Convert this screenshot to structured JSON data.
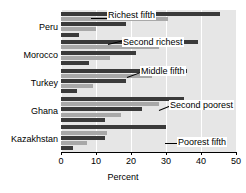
{
  "chart_data": {
    "type": "bar",
    "orientation": "horizontal",
    "title": "",
    "xlabel": "Percent",
    "ylabel": "",
    "xlim": [
      0,
      50
    ],
    "xticks": [
      0,
      10,
      20,
      30,
      40,
      50
    ],
    "grid": true,
    "legend_position": "annotations",
    "categories": [
      "Peru",
      "Morocco",
      "Turkey",
      "Ghana",
      "Kazakhstan"
    ],
    "series": [
      {
        "name": "Richest fifth",
        "values": [
          45.5,
          39.0,
          36.0,
          35.0,
          30.0
        ]
      },
      {
        "name": "Second richest",
        "values": [
          30.5,
          28.0,
          26.0,
          28.0,
          13.0
        ]
      },
      {
        "name": "Middle fifth",
        "values": [
          18.5,
          21.5,
          18.5,
          23.0,
          12.5
        ]
      },
      {
        "name": "Second poorest",
        "values": [
          10.0,
          14.0,
          9.0,
          17.0,
          7.5
        ]
      },
      {
        "name": "Poorest fifth",
        "values": [
          5.0,
          8.0,
          4.5,
          12.5,
          3.5
        ]
      }
    ],
    "annotations": [
      {
        "text": "Richest fifth",
        "points_to": "Peru / Richest fifth"
      },
      {
        "text": "Second richest",
        "points_to": "Morocco / Second richest"
      },
      {
        "text": "Middle fifth",
        "points_to": "Turkey / Middle fifth"
      },
      {
        "text": "Second poorest",
        "points_to": "Ghana / Second poorest"
      },
      {
        "text": "Poorest fifth",
        "points_to": "Kazakhstan / Poorest fifth"
      }
    ]
  },
  "axis": {
    "tick_0": "0",
    "tick_1": "10",
    "tick_2": "20",
    "tick_3": "30",
    "tick_4": "40",
    "tick_5": "50",
    "x_title": "Percent"
  },
  "categories": {
    "c0": "Peru",
    "c1": "Morocco",
    "c2": "Turkey",
    "c3": "Ghana",
    "c4": "Kazakhstan"
  },
  "callouts": {
    "richest": "Richest fifth",
    "second_richest": "Second richest",
    "middle": "Middle fifth",
    "second_poorest": "Second poorest",
    "poorest": "Poorest fifth"
  },
  "colors": {
    "bar_dark": "#3a3a3a",
    "bar_light": "#a8a8a8",
    "plot_background": "#e6e6e6",
    "gridline": "#ffffff",
    "axis": "#000000"
  }
}
